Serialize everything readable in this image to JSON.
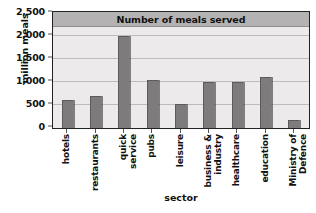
{
  "chart_data": {
    "type": "bar",
    "title": "Number of meals served",
    "xlabel": "sector",
    "ylabel": "million meals",
    "categories": [
      "hotels",
      "restaurants",
      "quick service",
      "pubs",
      "leisure",
      "business & industry",
      "healthcare",
      "education",
      "Ministry of Defence"
    ],
    "category_lines": [
      [
        "hotels"
      ],
      [
        "restaurants"
      ],
      [
        "quick",
        "service"
      ],
      [
        "pubs"
      ],
      [
        "leisure"
      ],
      [
        "business &",
        "industry"
      ],
      [
        "healthcare"
      ],
      [
        "education"
      ],
      [
        "Ministry of",
        "Defence"
      ]
    ],
    "values": [
      610,
      700,
      2000,
      1050,
      520,
      1000,
      1000,
      1110,
      180
    ],
    "ylim": [
      0,
      2500
    ],
    "yticks": [
      0,
      500,
      1000,
      1500,
      2000,
      2500
    ],
    "ytick_labels": [
      "0",
      "500",
      "1,000",
      "1,500",
      "2,000",
      "2,500"
    ],
    "grid": true,
    "legend": false,
    "bar_color": "#7d7b7b",
    "plot_background": "#eceaea",
    "title_banner_color": "#b4b2b2",
    "frame_color": "#222222",
    "gridline_color": "#bdbbbb"
  }
}
